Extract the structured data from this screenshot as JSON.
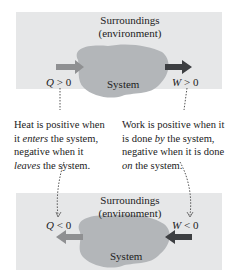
{
  "top_panel": {
    "surroundings": "Surroundings",
    "environment": "(environment)",
    "system": "System",
    "heat_label": {
      "var": "Q",
      "op": ">",
      "val": "0"
    },
    "work_label": {
      "var": "W",
      "op": ">",
      "val": "0"
    }
  },
  "bottom_panel": {
    "surroundings": "Surroundings",
    "environment": "(environment)",
    "system": "System",
    "heat_label": {
      "var": "Q",
      "op": "<",
      "val": "0"
    },
    "work_label": {
      "var": "W",
      "op": "<",
      "val": "0"
    }
  },
  "heat_description": {
    "l1": "Heat is positive when",
    "l2_pre": "it ",
    "l2_em": "enters",
    "l2_post": " the system,",
    "l3": "negative when it",
    "l4_em": "leaves",
    "l4_post": " the system."
  },
  "work_description": {
    "l1": "Work is positive when it",
    "l2_pre": "is done ",
    "l2_em": "by",
    "l2_post": " the system,",
    "l3": "negative when it is done",
    "l4_em": "on",
    "l4_post": " the system."
  },
  "colors": {
    "panel_bg": "#e6e7e8",
    "system_fill": "#b3b6b9",
    "heat_arrow": "#8f9092",
    "work_arrow": "#3d3f42"
  }
}
